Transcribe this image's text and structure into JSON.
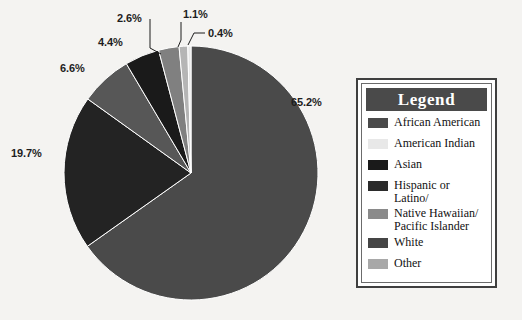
{
  "chart_data": {
    "type": "pie",
    "title": "",
    "labels": [
      "White",
      "African American",
      "Hispanic or Latino/",
      "Asian",
      "Native Hawaiian/\nPacific Islander",
      "Other",
      "American Indian"
    ],
    "values": [
      65.2,
      19.7,
      6.6,
      4.4,
      2.6,
      1.1,
      0.4
    ],
    "value_labels": [
      "65.2%",
      "19.7%",
      "6.6%",
      "4.4%",
      "2.6%",
      "1.1%",
      "0.4%"
    ],
    "colors": [
      "#4a4a4a",
      "#232323",
      "#575757",
      "#1a1a1a",
      "#808080",
      "#b5b5b5",
      "#e8e8e8"
    ],
    "units": "percent",
    "start_angle_deg": 0,
    "direction": "clockwise",
    "legend_position": "right",
    "grid": false
  },
  "legend": {
    "header": "Legend",
    "header_bg": "#4a4a4a",
    "header_text_color": "#ffffff",
    "border_color": "#3f3f3f",
    "items": [
      {
        "label": "African American",
        "color": "#4a4a4a"
      },
      {
        "label": "American Indian",
        "color": "#e8e8e8"
      },
      {
        "label": "Asian",
        "color": "#1a1a1a"
      },
      {
        "label": "Hispanic or Latino/",
        "color": "#2b2b2b"
      },
      {
        "label": "Native Hawaiian/\nPacific Islander",
        "color": "#8a8a8a"
      },
      {
        "label": "White",
        "color": "#454545"
      },
      {
        "label": "Other",
        "color": "#a8a8a8"
      }
    ]
  },
  "pie_labels": [
    {
      "text": "65.2%",
      "left": 291,
      "top": 96
    },
    {
      "text": "19.7%",
      "left": 11,
      "top": 147
    },
    {
      "text": "6.6%",
      "left": 60,
      "top": 62
    },
    {
      "text": "4.4%",
      "left": 98,
      "top": 36
    },
    {
      "text": "2.6%",
      "left": 117,
      "top": 12
    },
    {
      "text": "1.1%",
      "left": 183,
      "top": 8
    },
    {
      "text": "0.4%",
      "left": 208,
      "top": 27
    }
  ],
  "background_color": "#f4f3f1"
}
